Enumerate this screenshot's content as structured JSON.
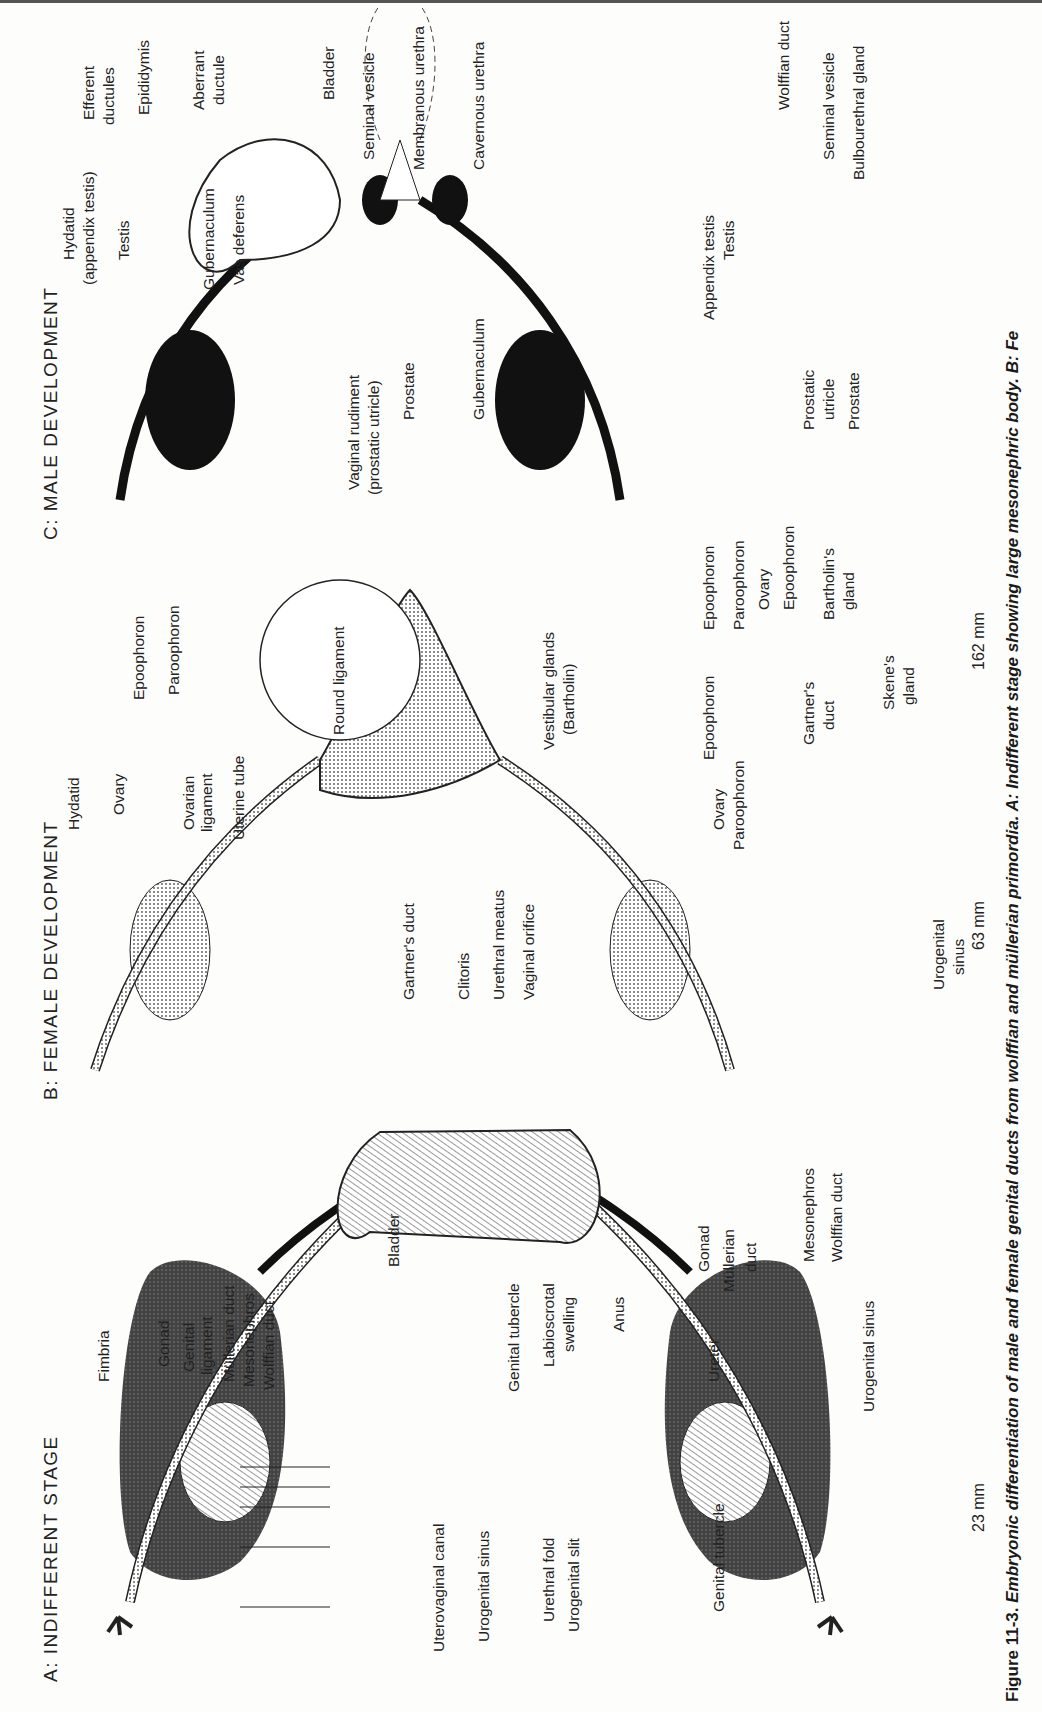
{
  "figure": {
    "caption_prefix": "Figure 11-3.",
    "caption_text": " Embryonic differentiation of male and female genital ducts from wolffian and müllerian primordia.  A: Indifferent stage showing large mesonephric body.  B: Fe"
  },
  "panel_a": {
    "title": "A:  INDIFFERENT STAGE",
    "labels": {
      "fimbria": "Fimbria",
      "gonad": "Gonad",
      "genital_ligament_1": "Genital",
      "genital_ligament_2": "ligament",
      "mullerian_duct": "Müllerian duct",
      "mesonephros": "Mesonephros",
      "wolffian_duct": "Wolffian duct",
      "bladder": "Bladder",
      "uterovaginal_canal": "Uterovaginal canal",
      "urogenital_sinus": "Urogenital sinus",
      "genital_tubercle": "Genital tubercle",
      "labioscrotal_1": "Labioscrotal",
      "labioscrotal_2": "swelling",
      "urethral_fold": "Urethral fold",
      "urogenital_slit": "Urogenital slit",
      "anus": "Anus"
    },
    "lateral": {
      "ureter": "Ureter",
      "gonad": "Gonad",
      "mullerian_1": "Müllerian",
      "mullerian_2": "duct",
      "mesonephros": "Mesonephros",
      "wolffian_duct": "Wolffian duct",
      "urogenital_sinus": "Urogenital sinus",
      "genital_tubercle": "Genital tubercle",
      "size": "23 mm"
    }
  },
  "panel_b": {
    "title": "B:  FEMALE DEVELOPMENT",
    "labels": {
      "hydatid": "Hydatid",
      "ovary": "Ovary",
      "ovarian_ligament_1": "Ovarian",
      "ovarian_ligament_2": "ligament",
      "uterine_tube": "Uterine tube",
      "epoophoron": "Epoophoron",
      "paroophoron": "Paroophoron",
      "round_ligament": "Round ligament",
      "gartners_duct": "Gartner's duct",
      "clitoris": "Clitoris",
      "urethral_meatus": "Urethral meatus",
      "vaginal_orifice": "Vaginal orifice",
      "vestibular_1": "Vestibular glands",
      "vestibular_2": "(Bartholin)"
    },
    "lateral_63": {
      "ovary": "Ovary",
      "paroophoron": "Paroophoron",
      "epoophoron": "Epoophoron",
      "gartners_1": "Gartner's",
      "gartners_2": "duct",
      "urogenital_1": "Urogenital",
      "urogenital_2": "sinus",
      "size": "63 mm"
    },
    "lateral_162": {
      "epoophoron_left": "Epoophoron",
      "paroophoron": "Paroophoron",
      "ovary": "Ovary",
      "epoophoron_right": "Epoophoron",
      "bartholins_1": "Bartholin's",
      "bartholins_2": "gland",
      "skenes_1": "Skene's",
      "skenes_2": "gland",
      "size": "162 mm"
    }
  },
  "panel_c": {
    "title": "C:  MALE DEVELOPMENT",
    "labels": {
      "hydatid_1": "Hydatid",
      "hydatid_2": "(appendix testis)",
      "testis": "Testis",
      "gubernaculum_top": "Gubernaculum",
      "vas_deferens": "Vas deferens",
      "efferent_1": "Efferent",
      "efferent_2": "ductules",
      "epididymis": "Epididymis",
      "aberrant_1": "Aberrant",
      "aberrant_2": "ductule",
      "bladder": "Bladder",
      "seminal_vesicle": "Seminal vesicle",
      "membranous_urethra": "Membranous urethra",
      "cavernous_urethra": "Cavernous urethra",
      "vaginal_rudiment_1": "Vaginal rudiment",
      "vaginal_rudiment_2": "(prostatic utricle)",
      "prostate": "Prostate",
      "gubernaculum_bottom": "Gubernaculum"
    },
    "lateral": {
      "appendix_testis": "Appendix testis",
      "testis": "Testis",
      "wolffian_duct": "Wolffian duct",
      "seminal_vesicle": "Seminal vesicle",
      "bulbourethral_gland": "Bulbourethral gland",
      "prostatic_utricle_1": "Prostatic",
      "prostatic_utricle_2": "utricle",
      "prostate": "Prostate"
    }
  }
}
